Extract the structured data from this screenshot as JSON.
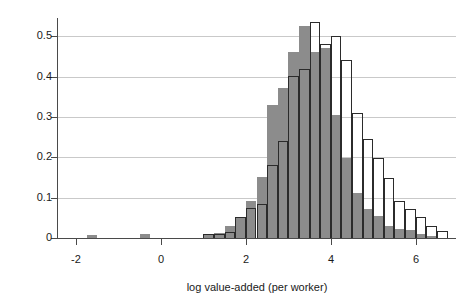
{
  "chart_data": {
    "type": "bar",
    "subtype": "overlaid-histogram",
    "title": "",
    "xlabel": "log value-added (per worker)",
    "ylabel": "Density",
    "xlim": [
      -2.45,
      6.95
    ],
    "ylim": [
      0,
      0.545
    ],
    "xticks": [
      -2,
      0,
      2,
      4,
      6
    ],
    "xtick_labels": [
      "-2",
      "0",
      "2",
      "4",
      "6"
    ],
    "yticks": [
      0,
      0.1,
      0.2,
      0.3,
      0.4,
      0.5
    ],
    "ytick_labels": [
      "0",
      "0.1",
      "0.2",
      "0.3",
      "0.4",
      "0.5"
    ],
    "grid": "horizontal",
    "legend": "none",
    "bin_width": 0.25,
    "colors": {
      "filled_series": "#8c8c8c",
      "outline_series": "#2b2b2b",
      "gridline": "#c9c9c9",
      "axis": "#4a4a4a",
      "background": "#ffffff",
      "text": "#1a1a1a"
    },
    "series": [
      {
        "name": "filled",
        "style": "solid-gray-fill",
        "bin_starts": [
          -1.75,
          -0.5,
          1.0,
          1.25,
          1.5,
          1.75,
          2.0,
          2.25,
          2.5,
          2.75,
          3.0,
          3.25,
          3.5,
          3.75,
          4.0,
          4.25,
          4.5,
          4.75,
          5.0,
          5.25,
          5.5,
          5.75,
          6.0,
          6.25
        ],
        "values": [
          0.008,
          0.01,
          0.01,
          0.012,
          0.03,
          0.052,
          0.092,
          0.15,
          0.33,
          0.372,
          0.462,
          0.525,
          0.462,
          0.47,
          0.305,
          0.198,
          0.112,
          0.072,
          0.055,
          0.03,
          0.022,
          0.02,
          0.01,
          0.004
        ]
      },
      {
        "name": "outline",
        "style": "open-black-outline",
        "bin_starts": [
          1.0,
          1.25,
          1.5,
          1.75,
          2.0,
          2.25,
          2.5,
          2.75,
          3.0,
          3.25,
          3.5,
          3.75,
          4.0,
          4.25,
          4.5,
          4.75,
          5.0,
          5.25,
          5.5,
          5.75,
          6.0,
          6.25,
          6.5
        ],
        "values": [
          0.01,
          0.01,
          0.014,
          0.052,
          0.075,
          0.085,
          0.182,
          0.24,
          0.402,
          0.418,
          0.535,
          0.48,
          0.5,
          0.442,
          0.31,
          0.245,
          0.198,
          0.148,
          0.092,
          0.072,
          0.052,
          0.03,
          0.018
        ]
      }
    ]
  },
  "axes": {
    "y_title": "Density",
    "x_title": "log value-added (per worker)"
  }
}
